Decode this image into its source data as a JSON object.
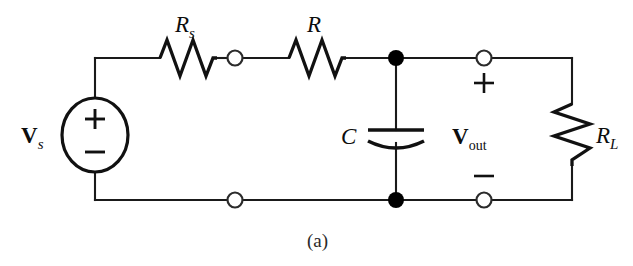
{
  "figure": {
    "caption": "(a)",
    "background_color": "#ffffff",
    "line_color": "#1a1a1a"
  },
  "labels": {
    "source": {
      "symbol": "V",
      "subscript": "s",
      "name": "source-voltage-label"
    },
    "series_resistor": {
      "symbol": "R",
      "subscript": "s",
      "name": "source-resistance-label"
    },
    "filter_resistor": {
      "symbol": "R",
      "subscript": "",
      "name": "filter-resistance-label"
    },
    "capacitor": {
      "symbol": "C",
      "subscript": "",
      "name": "capacitance-label"
    },
    "output": {
      "symbol": "V",
      "subscript": "out",
      "name": "output-voltage-label"
    },
    "load_resistor": {
      "symbol": "R",
      "subscript": "L",
      "name": "load-resistance-label"
    }
  },
  "polarity": {
    "source_plus": "+",
    "source_minus": "−",
    "output_plus": "+",
    "output_minus": "−"
  },
  "components": [
    {
      "id": "vs",
      "type": "voltage-source",
      "label": "Vs",
      "orientation": "vertical"
    },
    {
      "id": "rs",
      "type": "resistor",
      "label": "Rs",
      "orientation": "horizontal"
    },
    {
      "id": "r",
      "type": "resistor",
      "label": "R",
      "orientation": "horizontal"
    },
    {
      "id": "c",
      "type": "capacitor",
      "label": "C",
      "orientation": "vertical"
    },
    {
      "id": "rl",
      "type": "resistor",
      "label": "RL",
      "orientation": "vertical"
    }
  ],
  "nodes": {
    "open_terminals": 4,
    "junction_dots": 2
  }
}
